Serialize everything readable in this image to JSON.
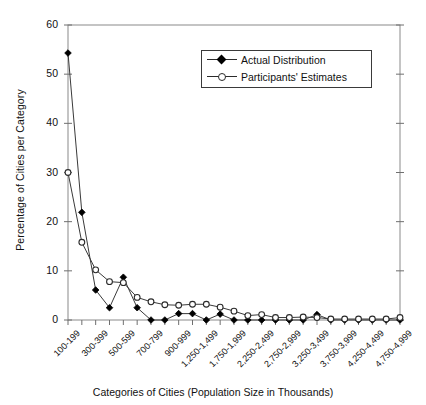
{
  "chart_data": {
    "type": "line",
    "title": "",
    "xlabel": "Categories of Cities (Population Size in Thousands)",
    "ylabel": "Percentage of Cities per Category",
    "ylim": [
      0,
      60
    ],
    "yticks": [
      0,
      10,
      20,
      30,
      40,
      50,
      60
    ],
    "ytick_labels": [
      "0",
      "10",
      "20",
      "30",
      "40",
      "50",
      "60"
    ],
    "grid": false,
    "legend_position": "upper-center",
    "categories": [
      "100-199",
      "200-299",
      "300-399",
      "400-499",
      "500-599",
      "600-699",
      "700-799",
      "800-899",
      "900-999",
      "1,000-1,249",
      "1,250-1,499",
      "1,500-1,749",
      "1,750-1,999",
      "2,000-2,249",
      "2,250-2,499",
      "2,500-2,749",
      "2,750-2,999",
      "3,000-3,249",
      "3,250-3,499",
      "3,500-3,749",
      "3,750-3,999",
      "4,000-4,249",
      "4,250-4,499",
      "4,500-4,749",
      "4,750-4,999"
    ],
    "xtick_labels_shown": [
      "100-199",
      "300-399",
      "500-599",
      "700-799",
      "900-999",
      "1,250-1,499",
      "1,750-1,999",
      "2,250-2,499",
      "2,750-2,999",
      "3,250-3,499",
      "3,750-3,999",
      "4,250-4,499",
      "4,750-4,999"
    ],
    "xtick_label_indices": [
      0,
      2,
      4,
      6,
      8,
      10,
      12,
      14,
      16,
      18,
      20,
      22,
      24
    ],
    "series": [
      {
        "name": "Actual Distribution",
        "marker": "filled-diamond",
        "color": "#000000",
        "values": [
          54.3,
          21.9,
          6.1,
          2.5,
          8.7,
          2.5,
          0.0,
          0.0,
          1.3,
          1.3,
          0.0,
          1.2,
          0.0,
          0.0,
          0.0,
          0.0,
          0.0,
          0.0,
          1.1,
          0.0,
          0.0,
          0.0,
          0.0,
          0.0,
          0.0
        ]
      },
      {
        "name": "Participants' Estimates",
        "marker": "open-circle",
        "color": "#2b2b2b",
        "values": [
          30.0,
          15.8,
          10.2,
          7.8,
          7.6,
          4.6,
          3.7,
          3.1,
          3.0,
          3.2,
          3.2,
          2.6,
          1.8,
          0.9,
          1.1,
          0.5,
          0.5,
          0.6,
          0.5,
          0.2,
          0.2,
          0.2,
          0.2,
          0.2,
          0.5
        ]
      }
    ]
  },
  "legend": {
    "items": [
      {
        "label": "Actual Distribution",
        "marker": "filled-diamond"
      },
      {
        "label": "Participants' Estimates",
        "marker": "open-circle"
      }
    ]
  },
  "axes": {
    "y_title": "Percentage of Cities per Category",
    "x_title": "Categories of Cities (Population Size in Thousands)"
  }
}
